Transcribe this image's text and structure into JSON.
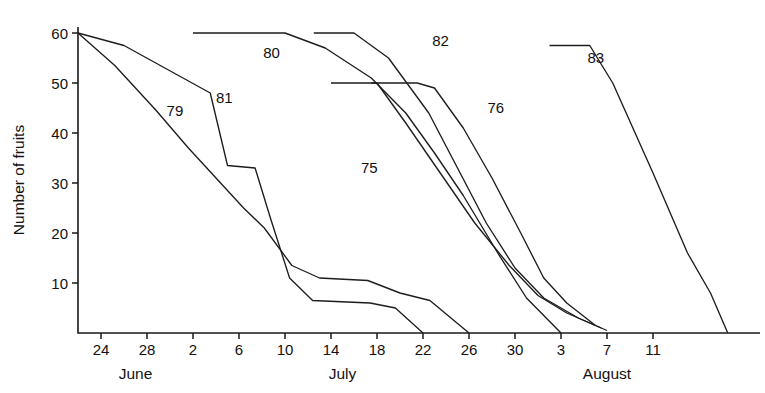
{
  "chart_data": {
    "type": "line",
    "title": "",
    "xlabel": "",
    "ylabel": "Number of fruits",
    "ylim": [
      0,
      60
    ],
    "yticks": [
      10,
      20,
      30,
      40,
      50,
      60
    ],
    "ytick_labels": [
      "10",
      "20",
      "30",
      "40",
      "50",
      "60"
    ],
    "xlim_days": [
      22,
      104
    ],
    "xticks_days": [
      24,
      28,
      32,
      36,
      40,
      44,
      48,
      52,
      56,
      60,
      64,
      68,
      72
    ],
    "xtick_labels": [
      "24",
      "28",
      "2",
      "6",
      "10",
      "14",
      "18",
      "22",
      "26",
      "30",
      "3",
      "7",
      "11"
    ],
    "month_labels": [
      {
        "text": "June",
        "day": 27
      },
      {
        "text": "July",
        "day": 45
      },
      {
        "text": "August",
        "day": 68
      }
    ],
    "grid": false,
    "legend": "inline-labels",
    "line_color": "#1d1d1d",
    "series": [
      {
        "name": "79",
        "label": "79",
        "label_day": 29.7,
        "label_value": 43.5,
        "points": [
          {
            "day": 22.0,
            "value": 60
          },
          {
            "day": 25.2,
            "value": 53.5
          },
          {
            "day": 28.8,
            "value": 44.5
          },
          {
            "day": 31.6,
            "value": 37.0
          },
          {
            "day": 36.4,
            "value": 25.0
          },
          {
            "day": 38.2,
            "value": 21.0
          },
          {
            "day": 40.6,
            "value": 13.5
          },
          {
            "day": 43.0,
            "value": 11.0
          },
          {
            "day": 47.2,
            "value": 10.5
          },
          {
            "day": 50.0,
            "value": 8.0
          },
          {
            "day": 52.6,
            "value": 6.5
          },
          {
            "day": 56.0,
            "value": 0
          }
        ]
      },
      {
        "name": "81",
        "label": "81",
        "label_day": 34.0,
        "label_value": 46.0,
        "points": [
          {
            "day": 22.0,
            "value": 60
          },
          {
            "day": 26.0,
            "value": 57.5
          },
          {
            "day": 33.5,
            "value": 48.0
          },
          {
            "day": 35.0,
            "value": 33.5
          },
          {
            "day": 37.4,
            "value": 33.0
          },
          {
            "day": 38.8,
            "value": 22.5
          },
          {
            "day": 40.4,
            "value": 11.0
          },
          {
            "day": 42.4,
            "value": 6.5
          },
          {
            "day": 47.4,
            "value": 6.0
          },
          {
            "day": 49.6,
            "value": 5.0
          },
          {
            "day": 52.0,
            "value": 0
          }
        ]
      },
      {
        "name": "80",
        "label": "80",
        "label_day": 38.1,
        "label_value": 55.0,
        "points": [
          {
            "day": 32.0,
            "value": 60
          },
          {
            "day": 40.0,
            "value": 60
          },
          {
            "day": 43.5,
            "value": 57.0
          },
          {
            "day": 47.5,
            "value": 51.0
          },
          {
            "day": 50.5,
            "value": 44.0
          },
          {
            "day": 53.0,
            "value": 36.0
          },
          {
            "day": 55.5,
            "value": 27.5
          },
          {
            "day": 58.5,
            "value": 16.0
          },
          {
            "day": 61.0,
            "value": 7.0
          },
          {
            "day": 64.0,
            "value": 0
          }
        ]
      },
      {
        "name": "82",
        "label": "82",
        "label_day": 52.8,
        "label_value": 57.5,
        "points": [
          {
            "day": 42.5,
            "value": 60
          },
          {
            "day": 46.0,
            "value": 60
          },
          {
            "day": 49.0,
            "value": 55.0
          },
          {
            "day": 52.5,
            "value": 44.0
          },
          {
            "day": 55.0,
            "value": 33.0
          },
          {
            "day": 57.5,
            "value": 22.0
          },
          {
            "day": 60.0,
            "value": 13.0
          },
          {
            "day": 62.5,
            "value": 7.0
          },
          {
            "day": 65.5,
            "value": 3.0
          },
          {
            "day": 68.0,
            "value": 0.5
          }
        ]
      },
      {
        "name": "75",
        "label": "75",
        "label_day": 46.6,
        "label_value": 32.0,
        "points": [
          {
            "day": 44.0,
            "value": 50
          },
          {
            "day": 48.0,
            "value": 50
          },
          {
            "day": 50.5,
            "value": 42.0
          },
          {
            "day": 53.5,
            "value": 32.0
          },
          {
            "day": 56.5,
            "value": 22.0
          },
          {
            "day": 59.5,
            "value": 13.5
          },
          {
            "day": 62.0,
            "value": 7.5
          },
          {
            "day": 64.5,
            "value": 4.0
          },
          {
            "day": 67.5,
            "value": 1.0
          }
        ]
      },
      {
        "name": "76",
        "label": "76",
        "label_day": 57.6,
        "label_value": 44.0,
        "points": [
          {
            "day": 47.5,
            "value": 50
          },
          {
            "day": 51.5,
            "value": 50
          },
          {
            "day": 53.0,
            "value": 49.0
          },
          {
            "day": 55.5,
            "value": 41.0
          },
          {
            "day": 58.0,
            "value": 31.0
          },
          {
            "day": 60.5,
            "value": 20.0
          },
          {
            "day": 62.5,
            "value": 11.0
          },
          {
            "day": 64.5,
            "value": 6.0
          },
          {
            "day": 67.0,
            "value": 1.5
          }
        ]
      },
      {
        "name": "83",
        "label": "83",
        "label_day": 66.3,
        "label_value": 54.0,
        "points": [
          {
            "day": 63.0,
            "value": 57.5
          },
          {
            "day": 66.5,
            "value": 57.5
          },
          {
            "day": 68.5,
            "value": 50.0
          },
          {
            "day": 72.0,
            "value": 32.0
          },
          {
            "day": 75.0,
            "value": 16.0
          },
          {
            "day": 77.0,
            "value": 8.0
          },
          {
            "day": 78.5,
            "value": 0
          }
        ]
      }
    ]
  }
}
